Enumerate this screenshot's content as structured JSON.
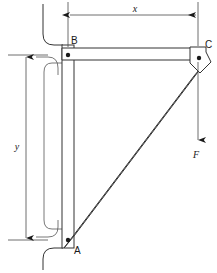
{
  "diagram": {
    "kind": "engineering-free-body-diagram",
    "background_color": "#ffffff",
    "line_color": "#333333",
    "text_color": "#1a1a1a"
  },
  "joints": [
    {
      "id": "A",
      "label": "A",
      "role": "lower wall pin support",
      "x": 68,
      "y": 240
    },
    {
      "id": "B",
      "label": "B",
      "role": "upper wall pin support",
      "x": 68,
      "y": 55
    },
    {
      "id": "C",
      "label": "C",
      "role": "outer load joint",
      "x": 198,
      "y": 57
    }
  ],
  "dimensions": [
    {
      "id": "x",
      "label": "x",
      "orientation": "horizontal",
      "measures": "horizontal distance from B to C",
      "from_joint": "B",
      "to_joint": "C",
      "line_y": 15,
      "start_x": 68,
      "end_x": 198,
      "label_x": 135,
      "label_y": 12,
      "arrows": "both"
    },
    {
      "id": "y",
      "label": "y",
      "orientation": "vertical",
      "measures": "vertical distance from B to A",
      "from_joint": "B",
      "to_joint": "A",
      "line_x": 26,
      "start_y": 55,
      "end_y": 240,
      "label_x": 17,
      "label_y": 146,
      "arrows": "both"
    }
  ],
  "force": {
    "id": "F",
    "label": "F",
    "direction": "downward",
    "applied_at_joint": "C",
    "tail_x": 198,
    "tail_y": 62,
    "head_y": 141,
    "label_x": 196,
    "label_y": 155
  },
  "members": [
    {
      "id": "vertical-post",
      "from": "B",
      "to": "A",
      "description": "vertical wall post carrying both pins"
    },
    {
      "id": "horizontal-arm",
      "from": "B",
      "to": "C",
      "description": "horizontal top arm"
    },
    {
      "id": "diagonal-strut",
      "from": "A",
      "to": "C",
      "description": "inclined diagonal strut"
    }
  ],
  "wall": {
    "id": "wall-profile",
    "description": "sectioned wall face with rounded break lines at top and bottom"
  }
}
